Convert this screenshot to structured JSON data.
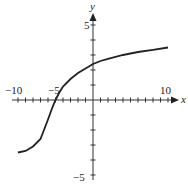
{
  "chart_data": {
    "type": "line",
    "title": "",
    "xlabel": "x",
    "ylabel": "y",
    "xlim": [
      -10,
      10
    ],
    "ylim": [
      -5,
      5
    ],
    "x_tick_labels": [
      "-10",
      "-5",
      "10"
    ],
    "y_tick_labels": [
      "5",
      "-5"
    ],
    "grid": false,
    "series": [
      {
        "name": "f(x)",
        "x": [
          -10,
          -9,
          -8,
          -7,
          -6,
          -5.5,
          -5,
          -4.5,
          -4,
          -3,
          -2,
          -1,
          0,
          1,
          2,
          4,
          6,
          8,
          10
        ],
        "values": [
          -3.5,
          -3.4,
          -3.1,
          -2.6,
          -1.3,
          -0.6,
          0,
          0.5,
          0.9,
          1.4,
          1.8,
          2.1,
          2.4,
          2.6,
          2.75,
          3.0,
          3.2,
          3.35,
          3.5
        ]
      }
    ]
  },
  "labels": {
    "x_axis": "x",
    "y_axis": "y",
    "x_neg10": "−10",
    "x_neg5": "−5",
    "x_10": "10",
    "y_5": "5",
    "y_neg5": "−5"
  }
}
